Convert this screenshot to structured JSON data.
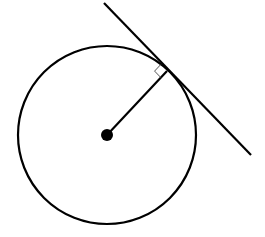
{
  "diagram": {
    "title": "",
    "colors": {
      "stroke": "#000000",
      "background": "#ffffff"
    },
    "circle": {
      "cx": 107,
      "cy": 135,
      "r": 89
    },
    "center_point": {
      "cx": 107,
      "cy": 135,
      "r": 6
    },
    "radius_segment": {
      "x1": 107,
      "y1": 135,
      "x2": 167,
      "y2": 71
    },
    "tangent_line": {
      "x1": 104,
      "y1": 3,
      "x2": 251,
      "y2": 155
    },
    "right_angle_marker": {
      "size": 9
    },
    "labels": []
  }
}
